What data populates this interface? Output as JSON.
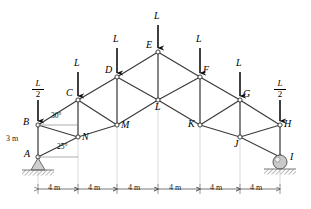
{
  "figure": {
    "type": "statics-truss-free-body-diagram"
  },
  "nodes": [
    {
      "id": "A",
      "label": "A",
      "x": 38,
      "y": 157,
      "label_dx": -11,
      "label_dy": -6
    },
    {
      "id": "B",
      "label": "B",
      "x": 38,
      "y": 125,
      "label_dx": -12,
      "label_dy": -6
    },
    {
      "id": "C",
      "label": "C",
      "x": 78,
      "y": 100,
      "label_dx": -10,
      "label_dy": -10
    },
    {
      "id": "D",
      "label": "D",
      "x": 117,
      "y": 77,
      "label_dx": -10,
      "label_dy": -10
    },
    {
      "id": "E",
      "label": "E",
      "x": 158,
      "y": 52,
      "label_dx": -10,
      "label_dy": -10
    },
    {
      "id": "F",
      "label": "F",
      "x": 200,
      "y": 77,
      "label_dx": 3,
      "label_dy": -10
    },
    {
      "id": "G",
      "label": "G",
      "x": 240,
      "y": 100,
      "label_dx": 3,
      "label_dy": -10
    },
    {
      "id": "H",
      "label": "H",
      "x": 280,
      "y": 125,
      "label_dx": 4,
      "label_dy": -5
    },
    {
      "id": "I",
      "label": "I",
      "x": 280,
      "y": 157,
      "label_dx": 6,
      "label_dy": -5
    },
    {
      "id": "J",
      "label": "J",
      "x": 240,
      "y": 137,
      "label_dx": -4,
      "label_dy": -12
    },
    {
      "id": "K",
      "label": "K",
      "x": 200,
      "y": 125,
      "label_dx": -12,
      "label_dy": -5
    },
    {
      "id": "L",
      "label": "L",
      "x": 158,
      "y": 100,
      "label_dx": -4,
      "label_dy": 1
    },
    {
      "id": "M",
      "label": "M",
      "x": 117,
      "y": 125,
      "label_dx": 3,
      "label_dy": -4
    },
    {
      "id": "N",
      "label": "N",
      "x": 78,
      "y": 137,
      "label_dx": 3,
      "label_dy": -5
    }
  ],
  "members": [
    [
      "A",
      "B"
    ],
    [
      "A",
      "N"
    ],
    [
      "B",
      "C"
    ],
    [
      "B",
      "N"
    ],
    [
      "C",
      "N"
    ],
    [
      "C",
      "D"
    ],
    [
      "C",
      "M"
    ],
    [
      "N",
      "M"
    ],
    [
      "M",
      "D"
    ],
    [
      "M",
      "L"
    ],
    [
      "D",
      "E"
    ],
    [
      "D",
      "L"
    ],
    [
      "E",
      "L"
    ],
    [
      "E",
      "F"
    ],
    [
      "L",
      "F"
    ],
    [
      "L",
      "K"
    ],
    [
      "F",
      "K"
    ],
    [
      "F",
      "G"
    ],
    [
      "K",
      "J"
    ],
    [
      "K",
      "G"
    ],
    [
      "G",
      "J"
    ],
    [
      "G",
      "H"
    ],
    [
      "J",
      "H"
    ],
    [
      "J",
      "I"
    ],
    [
      "H",
      "I"
    ]
  ],
  "loads": [
    {
      "node": "B",
      "text": "L/2",
      "numerator": "L",
      "denominator": "2",
      "fraction": true,
      "x": 38,
      "arrow_top": 100,
      "arrow_bottom": 122,
      "label_x": 31,
      "label_y": 80
    },
    {
      "node": "C",
      "text": "L",
      "numerator": "L",
      "denominator": "",
      "fraction": false,
      "x": 78,
      "arrow_top": 72,
      "arrow_bottom": 97,
      "label_x": 74,
      "label_y": 58
    },
    {
      "node": "D",
      "text": "L",
      "numerator": "L",
      "denominator": "",
      "fraction": false,
      "x": 117,
      "arrow_top": 48,
      "arrow_bottom": 74,
      "label_x": 113,
      "label_y": 34
    },
    {
      "node": "E",
      "text": "L",
      "numerator": "L",
      "denominator": "",
      "fraction": false,
      "x": 158,
      "arrow_top": 25,
      "arrow_bottom": 49,
      "label_x": 154,
      "label_y": 11
    },
    {
      "node": "F",
      "text": "L",
      "numerator": "L",
      "denominator": "",
      "fraction": false,
      "x": 200,
      "arrow_top": 48,
      "arrow_bottom": 74,
      "label_x": 196,
      "label_y": 34
    },
    {
      "node": "G",
      "text": "L",
      "numerator": "L",
      "denominator": "",
      "fraction": false,
      "x": 240,
      "arrow_top": 72,
      "arrow_bottom": 97,
      "label_x": 236,
      "label_y": 58
    },
    {
      "node": "H",
      "text": "L/2",
      "numerator": "L",
      "denominator": "2",
      "fraction": true,
      "x": 280,
      "arrow_top": 100,
      "arrow_bottom": 122,
      "label_x": 273,
      "label_y": 80
    }
  ],
  "angles": [
    {
      "id": "angle-at-B",
      "value": "30°",
      "label_x": 52,
      "label_y": 115,
      "vertex": "B"
    },
    {
      "id": "angle-at-A",
      "value": "25°",
      "label_x": 58,
      "label_y": 147,
      "vertex": "A"
    }
  ],
  "dimensions": {
    "height": {
      "value": "3 m",
      "label_x": 7,
      "label_y": 137
    },
    "baseline_y": 189,
    "bays": [
      {
        "value": "4 m",
        "x_start": 38,
        "x_end": 78,
        "label_x": 46
      },
      {
        "value": "4 m",
        "x_start": 78,
        "x_end": 117,
        "label_x": 86
      },
      {
        "value": "4 m",
        "x_start": 117,
        "x_end": 158,
        "label_x": 126
      },
      {
        "value": "4 m",
        "x_start": 158,
        "x_end": 200,
        "label_x": 167
      },
      {
        "value": "4 m",
        "x_start": 200,
        "x_end": 240,
        "label_x": 208
      },
      {
        "value": "4 m",
        "x_start": 240,
        "x_end": 280,
        "label_x": 248
      }
    ]
  },
  "supports": [
    {
      "id": "pin-support",
      "type": "pin",
      "node": "A",
      "x": 38,
      "y": 157
    },
    {
      "id": "roller-support",
      "type": "roller",
      "node": "I",
      "x": 280,
      "y": 157
    }
  ],
  "colors": {
    "member": "#3c3c3c",
    "load_arrow": "#111111",
    "ground_hatch": "#9a9a9a",
    "extension_line": "#c8c8c8",
    "dimension_line": "#555555",
    "text": "#000000"
  }
}
